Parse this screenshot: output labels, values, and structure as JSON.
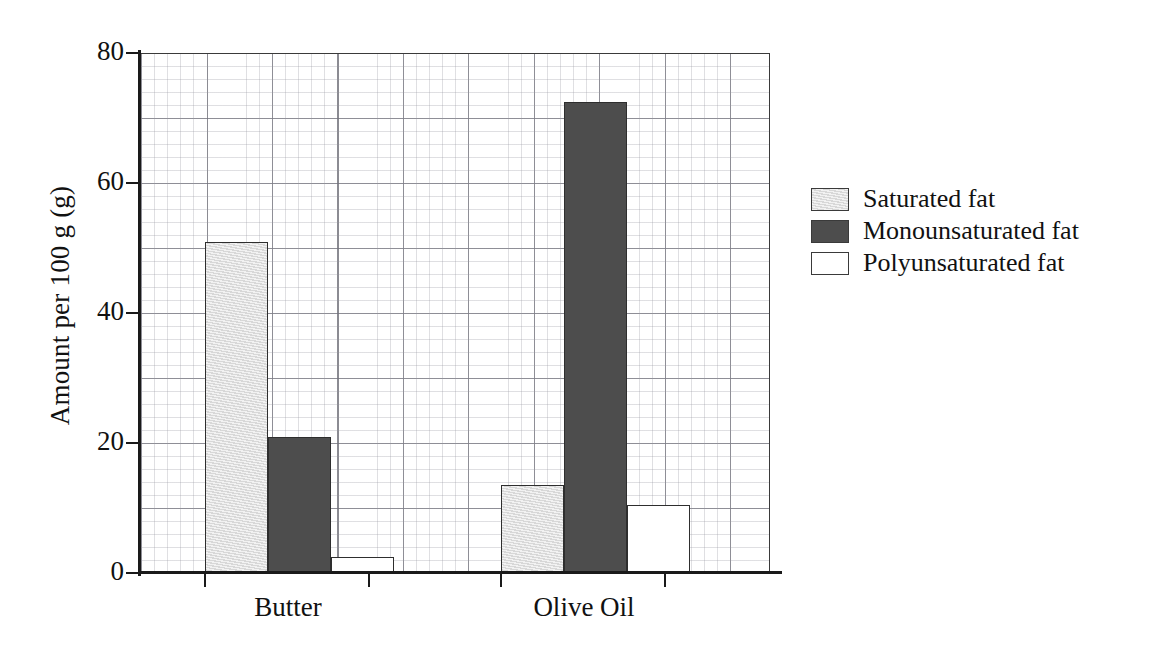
{
  "chart_data": {
    "type": "bar",
    "title": "",
    "xlabel": "",
    "ylabel": "Amount per 100 g (g)",
    "categories": [
      "Butter",
      "Olive Oil"
    ],
    "series": [
      {
        "name": "Saturated fat",
        "color": "#e2e2e2",
        "values": [
          51,
          13.5
        ]
      },
      {
        "name": "Monounsaturated fat",
        "color": "#4d4d4d",
        "values": [
          21,
          72.5
        ]
      },
      {
        "name": "Polyunsaturated fat",
        "color": "#ffffff",
        "values": [
          2.5,
          10.5
        ]
      }
    ],
    "ylim": [
      0,
      80
    ],
    "yticks": [
      0,
      20,
      40,
      60,
      80
    ],
    "ytick_labels": [
      "0",
      "20",
      "40",
      "60",
      "80"
    ],
    "grid": true,
    "grid_major_step": 10,
    "grid_minor_step": 2,
    "legend_position": "right"
  },
  "axes": {
    "y_title": "Amount per 100 g (g)",
    "y_ticks": [
      {
        "value": 80,
        "label": "80"
      },
      {
        "value": 60,
        "label": "60"
      },
      {
        "value": 40,
        "label": "40"
      },
      {
        "value": 20,
        "label": "20"
      },
      {
        "value": 0,
        "label": "0"
      }
    ],
    "x_categories": [
      {
        "label": "Butter"
      },
      {
        "label": "Olive Oil"
      }
    ]
  },
  "legend": {
    "items": [
      {
        "label": "Saturated fat",
        "swatch": "light-gray"
      },
      {
        "label": "Monounsaturated fat",
        "swatch": "dark-gray"
      },
      {
        "label": "Polyunsaturated fat",
        "swatch": "white"
      }
    ]
  }
}
